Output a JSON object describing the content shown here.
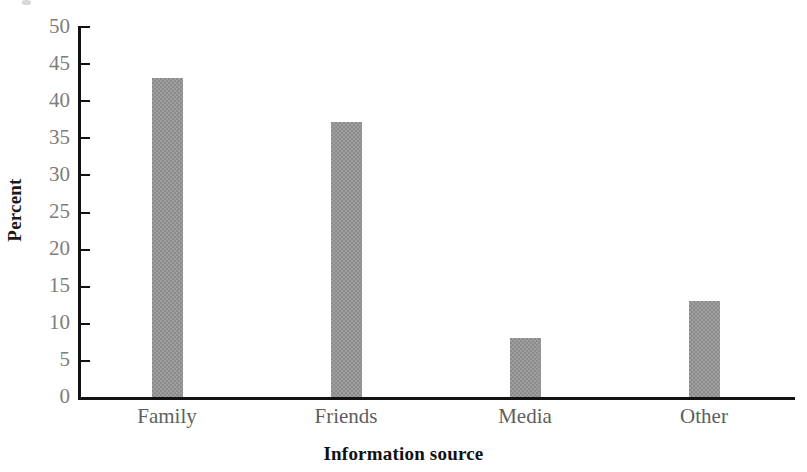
{
  "chart_data": {
    "type": "bar",
    "title": "",
    "categories": [
      "Family",
      "Friends",
      "Media",
      "Other"
    ],
    "values": [
      43,
      37,
      8,
      13
    ],
    "series": [
      {
        "name": "Percent",
        "values": [
          43,
          37,
          8,
          13
        ]
      }
    ],
    "xlabel": "Information source",
    "ylabel": "Percent",
    "ylim": [
      0,
      50
    ],
    "ytick_step": 5,
    "yticks": [
      "50",
      "45",
      "40",
      "35",
      "30",
      "25",
      "20",
      "15",
      "10",
      "5",
      "0"
    ],
    "grid": false,
    "legend": false,
    "bar_color": "#8c8c8c",
    "axis_color": "#121212",
    "tick_label_color": "#7d7d7d"
  }
}
